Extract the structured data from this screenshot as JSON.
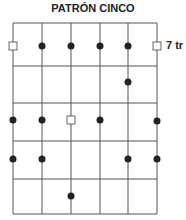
{
  "title": "PATRÓN CINCO",
  "row_label": "7 tr",
  "grid": {
    "x_lines": [
      13,
      42,
      71,
      100,
      128,
      157
    ],
    "y_lines": [
      23,
      66,
      103,
      141,
      179,
      214
    ]
  },
  "markers": [
    {
      "type": "square",
      "x": 13,
      "y": 46
    },
    {
      "type": "dot",
      "x": 42,
      "y": 46
    },
    {
      "type": "dot",
      "x": 71,
      "y": 46
    },
    {
      "type": "dot",
      "x": 100,
      "y": 46
    },
    {
      "type": "dot",
      "x": 128,
      "y": 46
    },
    {
      "type": "square",
      "x": 157,
      "y": 46
    },
    {
      "type": "dot",
      "x": 128,
      "y": 82
    },
    {
      "type": "dot",
      "x": 13,
      "y": 120
    },
    {
      "type": "dot",
      "x": 42,
      "y": 120
    },
    {
      "type": "square",
      "x": 71,
      "y": 120
    },
    {
      "type": "dot",
      "x": 100,
      "y": 120
    },
    {
      "type": "dot",
      "x": 157,
      "y": 121
    },
    {
      "type": "dot",
      "x": 13,
      "y": 159
    },
    {
      "type": "dot",
      "x": 42,
      "y": 159
    },
    {
      "type": "dot",
      "x": 128,
      "y": 159
    },
    {
      "type": "dot",
      "x": 157,
      "y": 159
    },
    {
      "type": "dot",
      "x": 71,
      "y": 196
    }
  ]
}
